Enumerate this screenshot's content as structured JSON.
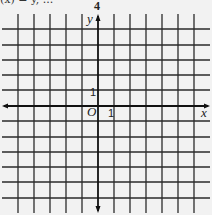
{
  "caption": "(x) = y, ...",
  "top_label": "4",
  "axes": {
    "x_label": "x",
    "y_label": "y",
    "origin_label": "O",
    "x_unit_label": "1",
    "y_unit_label": "1"
  },
  "grid": {
    "columns": 12,
    "rows": 12,
    "line_color": "#2a2a2a",
    "axis_color": "#111111",
    "background": "#f2f2f2"
  }
}
